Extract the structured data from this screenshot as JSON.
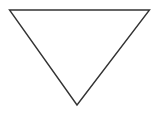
{
  "diagram": {
    "shape": "inverted-triangle",
    "background": "#ffffff",
    "stroke_color": "#333333",
    "fill_color": "#ffffff",
    "stroke_width": 1.4,
    "vertices": {
      "top_left": [
        9.5,
        10
      ],
      "top_right": [
        149.5,
        10
      ],
      "bottom_apex": [
        77,
        105
      ]
    }
  }
}
